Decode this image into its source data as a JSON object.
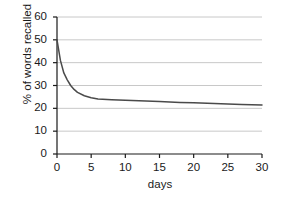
{
  "chart_data": {
    "type": "line",
    "title": "",
    "xlabel": "days",
    "ylabel": "% of words recalled",
    "xlim": [
      0,
      30
    ],
    "ylim": [
      0,
      60
    ],
    "xticks": [
      0,
      5,
      10,
      15,
      20,
      25,
      30
    ],
    "yticks": [
      0,
      10,
      20,
      30,
      40,
      50,
      60
    ],
    "xtick_labels": [
      "0",
      "5",
      "10",
      "15",
      "20",
      "25",
      "30"
    ],
    "ytick_labels": [
      "0",
      "10",
      "20",
      "30",
      "40",
      "50",
      "60"
    ],
    "grid": "horizontal",
    "legend": "none",
    "series": [
      {
        "name": "% of words recalled",
        "color": "#4a4a4a",
        "x": [
          0,
          0.5,
          1,
          1.5,
          2,
          2.5,
          3,
          4,
          5,
          6,
          8,
          10,
          12,
          15,
          18,
          20,
          24,
          27,
          30
        ],
        "values": [
          50,
          41,
          35.5,
          32.5,
          30,
          28.3,
          27,
          25.5,
          24.6,
          24.1,
          23.8,
          23.5,
          23.3,
          23,
          22.6,
          22.4,
          22,
          21.7,
          21.5
        ]
      }
    ]
  },
  "axes": {
    "y_title": "% of words recalled",
    "x_title": "days"
  },
  "colors": {
    "grid": "#c8c8c8",
    "axis": "#1a1a1a",
    "curve": "#4a4a4a",
    "background": "#ffffff"
  }
}
